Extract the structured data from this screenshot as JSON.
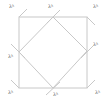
{
  "diagram": {
    "title": "",
    "stroke_color": "#c8c8c8",
    "outer_square": {
      "x1": 19,
      "y1": 17,
      "x2": 87,
      "y2": 88
    },
    "inner_diamond": [
      [
        53,
        17
      ],
      [
        87,
        51
      ],
      [
        53,
        88
      ],
      [
        19,
        52
      ]
    ],
    "labels": [
      {
        "id": "top-left",
        "text": "λᵏ",
        "x": 9,
        "y": 4
      },
      {
        "id": "top-mid",
        "text": "λᵏ",
        "x": 48,
        "y": 4
      },
      {
        "id": "top-right",
        "text": "λᵏ",
        "x": 93,
        "y": 4
      },
      {
        "id": "mid-left",
        "text": "λᵏ",
        "x": 8,
        "y": 54
      },
      {
        "id": "mid-right",
        "text": "λᵏ",
        "x": 93,
        "y": 42
      },
      {
        "id": "bottom-left",
        "text": "λᵏ",
        "x": 8,
        "y": 90
      },
      {
        "id": "bottom-mid",
        "text": "λᵏ",
        "x": 53,
        "y": 92
      },
      {
        "id": "bottom-right",
        "text": "λᵏ",
        "x": 95,
        "y": 90
      }
    ]
  }
}
